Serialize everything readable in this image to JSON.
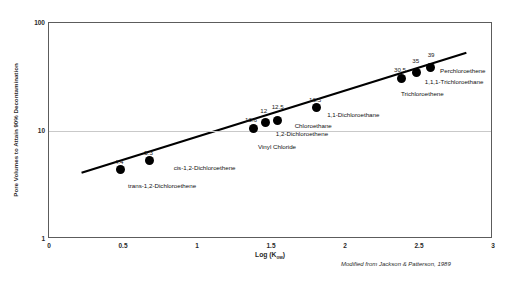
{
  "chart_data": {
    "type": "scatter",
    "title": "",
    "xlabel": "Log (Kow)",
    "xlabel_text": "Log (K",
    "xlabel_sub": "ow",
    "xlabel_close": ")",
    "ylabel": "Pore Volumes to Attain 90% Decontamination",
    "xlim": [
      0,
      3
    ],
    "ylim": [
      1,
      100
    ],
    "yscale": "log",
    "xticks": [
      "0",
      "0.5",
      "1",
      "1.5",
      "2",
      "2.5",
      "3"
    ],
    "xtick_values": [
      0,
      0.5,
      1,
      1.5,
      2,
      2.5,
      3
    ],
    "yticks": [
      "1",
      "10",
      "100"
    ],
    "ytick_values": [
      1,
      10,
      100
    ],
    "grid": true,
    "grid_axis": "y",
    "legend": "none",
    "annotation": "Modified from Jackson & Patterson, 1989",
    "trendline": {
      "x_start": 0.22,
      "y_start": 4.1,
      "x_end": 2.82,
      "y_end": 53.0,
      "color": "#000000",
      "width": 2.2
    },
    "points": [
      {
        "label": "trans-1,2-Dichloroethene",
        "value": "4.4",
        "x": 0.48,
        "y": 4.4,
        "value_dx": -1,
        "value_dy": -11,
        "name_dx": 8,
        "name_dy": 13,
        "name_anchor": "start"
      },
      {
        "label": "cis-1,2-Dichloroethene",
        "value": "5.3",
        "x": 0.68,
        "y": 5.3,
        "value_dx": -1,
        "value_dy": -11,
        "name_dx": 24,
        "name_dy": 4,
        "name_anchor": "start"
      },
      {
        "label": "Vinyl Chloride",
        "value": "10.6",
        "x": 1.385,
        "y": 10.6,
        "value_dx": -3,
        "value_dy": -11,
        "name_dx": 4,
        "name_dy": 16,
        "name_anchor": "start"
      },
      {
        "label": "1,2-Dichloroethene",
        "value": "12",
        "x": 1.465,
        "y": 12.0,
        "value_dx": -2,
        "value_dy": -14,
        "name_dx": 10,
        "name_dy": 9,
        "name_anchor": "start"
      },
      {
        "label": "Chloroethane",
        "value": "12.5",
        "x": 1.545,
        "y": 12.5,
        "value_dx": 0,
        "value_dy": -17,
        "name_dx": 17,
        "name_dy": 2,
        "name_anchor": "start"
      },
      {
        "label": "1,1-Dichloroethane",
        "value": "16.5",
        "x": 1.805,
        "y": 16.5,
        "value_dx": -1,
        "value_dy": -11,
        "name_dx": 11,
        "name_dy": 4,
        "name_anchor": "start"
      },
      {
        "label": "Trichloroethene",
        "value": "30.5",
        "x": 2.385,
        "y": 30.5,
        "value_dx": -2,
        "value_dy": -12,
        "name_dx": -1,
        "name_dy": 12,
        "name_anchor": "start"
      },
      {
        "label": "1,1,1-Trichloroethane",
        "value": "35",
        "x": 2.485,
        "y": 35.0,
        "value_dx": -1,
        "value_dy": -14,
        "name_dx": 8,
        "name_dy": 7,
        "name_anchor": "start"
      },
      {
        "label": "Perchloroethene",
        "value": "39",
        "x": 2.575,
        "y": 39.0,
        "value_dx": 1,
        "value_dy": -15,
        "name_dx": 10,
        "name_dy": 1,
        "name_anchor": "start"
      }
    ]
  }
}
